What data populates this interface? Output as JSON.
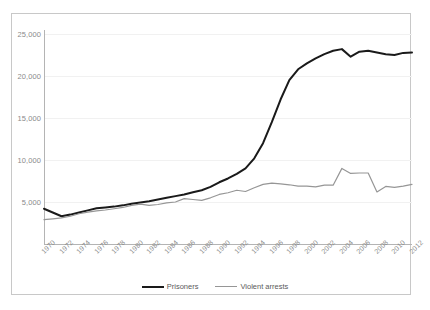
{
  "chart_data": {
    "type": "line",
    "title": "",
    "subtitle": "",
    "xlabel": "",
    "ylabel": "",
    "ylim": [
      0,
      25000
    ],
    "xlim": [
      1970,
      2012
    ],
    "grid": true,
    "legend_position": "bottom",
    "ytick_labels": [
      "25,000",
      "20,000",
      "15,000",
      "10,000",
      "5,000"
    ],
    "ytick_values": [
      25000,
      20000,
      15000,
      10000,
      5000
    ],
    "xtick_labels": [
      "1970",
      "1972",
      "1974",
      "1976",
      "1978",
      "1980",
      "1982",
      "1984",
      "1986",
      "1988",
      "1990",
      "1992",
      "1994",
      "1996",
      "1998",
      "2000",
      "2002",
      "2004",
      "2006",
      "2008",
      "2010",
      "2012"
    ],
    "x": [
      1970,
      1971,
      1972,
      1973,
      1974,
      1975,
      1976,
      1977,
      1978,
      1979,
      1980,
      1981,
      1982,
      1983,
      1984,
      1985,
      1986,
      1987,
      1988,
      1989,
      1990,
      1991,
      1992,
      1993,
      1994,
      1995,
      1996,
      1997,
      1998,
      1999,
      2000,
      2001,
      2002,
      2003,
      2004,
      2005,
      2006,
      2007,
      2008,
      2009,
      2010,
      2011,
      2012
    ],
    "series": [
      {
        "name": "Prisoners",
        "color": "#1a1a1a",
        "width": 2.0,
        "values": [
          4200,
          3750,
          3300,
          3500,
          3750,
          4000,
          4250,
          4350,
          4450,
          4600,
          4800,
          4950,
          5100,
          5300,
          5500,
          5700,
          5900,
          6150,
          6400,
          6800,
          7350,
          7800,
          8350,
          9000,
          10200,
          12000,
          14500,
          17200,
          19500,
          20800,
          21500,
          22100,
          22600,
          23000,
          23200,
          22300,
          22900,
          23000,
          22800,
          22600,
          22500,
          22750,
          22800
        ]
      },
      {
        "name": "Violent arrests",
        "color": "#969696",
        "width": 1.2,
        "values": [
          2900,
          3000,
          3100,
          3300,
          3600,
          3800,
          3950,
          4050,
          4200,
          4350,
          4600,
          4750,
          4600,
          4700,
          4900,
          5000,
          5400,
          5300,
          5200,
          5500,
          5900,
          6100,
          6400,
          6250,
          6700,
          7100,
          7250,
          7150,
          7050,
          6900,
          6900,
          6800,
          7000,
          7000,
          9000,
          8400,
          8450,
          8450,
          6200,
          6850,
          6750,
          6900,
          7100
        ]
      }
    ]
  },
  "legend": {
    "entries": [
      {
        "label": "Prisoners"
      },
      {
        "label": "Violent arrests"
      }
    ]
  }
}
